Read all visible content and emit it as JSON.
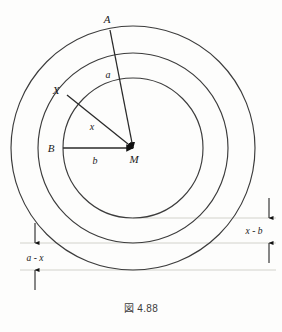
{
  "figure": {
    "caption": "図 4.88",
    "background_color": "#fdfdfc",
    "stroke_color": "#3c3c3c",
    "guide_color": "#cfcfc8",
    "label_color": "#1a1a1a",
    "center": {
      "x": 133,
      "y": 148,
      "label": "M"
    },
    "circles": [
      {
        "name": "inner-circle",
        "radius": 70,
        "label": "b"
      },
      {
        "name": "middle-circle",
        "radius": 95,
        "label": "x"
      },
      {
        "name": "outer-circle",
        "radius": 122,
        "label": "a"
      }
    ],
    "points": [
      {
        "name": "point-a",
        "label": "A",
        "x": 110,
        "y": 30,
        "label_x": 107,
        "label_y": 23
      },
      {
        "name": "point-x",
        "label": "X",
        "x": 67,
        "y": 95,
        "label_x": 56,
        "label_y": 94
      },
      {
        "name": "point-b",
        "label": "B",
        "x": 63,
        "y": 148,
        "label_x": 51,
        "label_y": 152
      },
      {
        "name": "point-m",
        "label": "M",
        "x": 133,
        "y": 148,
        "label_x": 132,
        "label_y": 162
      }
    ],
    "radii_lines": [
      {
        "name": "radius-ma",
        "from": "M",
        "to": "A",
        "label": "a",
        "label_x": 107,
        "label_y": 78
      },
      {
        "name": "radius-mx",
        "from": "M",
        "to": "X",
        "label": "x",
        "label_x": 91,
        "label_y": 130
      },
      {
        "name": "radius-mb",
        "from": "M",
        "to": "B",
        "label": "b",
        "label_x": 93,
        "label_y": 163
      }
    ],
    "annotations": [
      {
        "name": "annotation-x-minus-b",
        "label": "x - b",
        "label_x": 245,
        "label_y": 234,
        "guide_y_top": 218,
        "guide_y_bottom": 243,
        "arrow_x": 269
      },
      {
        "name": "annotation-a-minus-x",
        "label": "a - x",
        "label_x": 22,
        "label_y": 261,
        "guide_y_top": 243,
        "guide_y_bottom": 270,
        "arrow_x": 35
      }
    ],
    "guides": [
      {
        "name": "guide-inner-bottom",
        "y": 218,
        "x1": 133,
        "x2": 276
      },
      {
        "name": "guide-middle-bottom",
        "y": 243,
        "x1": 20,
        "x2": 276
      },
      {
        "name": "guide-outer-bottom",
        "y": 270,
        "x1": 20,
        "x2": 276
      }
    ]
  }
}
